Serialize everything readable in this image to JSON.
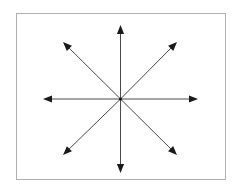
{
  "figure": {
    "type": "diagram",
    "canvas": {
      "width": 240,
      "height": 191,
      "background": "#ffffff"
    },
    "frame": {
      "name": "rectangular-border",
      "x": 16,
      "y": 13,
      "width": 210,
      "height": 167,
      "stroke_color": "#b0b0b0",
      "stroke_width": 1,
      "fill": "#ffffff"
    },
    "center": {
      "x": 120.5,
      "y": 99,
      "label": "origin"
    },
    "line_style": {
      "stroke_color": "#4a4a4a",
      "stroke_width": 1,
      "arrowhead_color": "#1a1a1a",
      "arrowhead_length": 9,
      "arrowhead_half_width": 3.6
    },
    "arrow_count": 8,
    "arrows": [
      {
        "name": "arrow-north",
        "direction": "N",
        "angle_deg": 90,
        "tip_x": 120.5,
        "tip_y": 25
      },
      {
        "name": "arrow-northeast",
        "direction": "NE",
        "angle_deg": 45,
        "tip_x": 177,
        "tip_y": 42
      },
      {
        "name": "arrow-east",
        "direction": "E",
        "angle_deg": 0,
        "tip_x": 198,
        "tip_y": 99
      },
      {
        "name": "arrow-southeast",
        "direction": "SE",
        "angle_deg": -45,
        "tip_x": 177,
        "tip_y": 155
      },
      {
        "name": "arrow-south",
        "direction": "S",
        "angle_deg": -90,
        "tip_x": 120.5,
        "tip_y": 173
      },
      {
        "name": "arrow-southwest",
        "direction": "SW",
        "angle_deg": 225,
        "tip_x": 63,
        "tip_y": 155
      },
      {
        "name": "arrow-west",
        "direction": "W",
        "angle_deg": 180,
        "tip_x": 43,
        "tip_y": 99
      },
      {
        "name": "arrow-northwest",
        "direction": "NW",
        "angle_deg": 135,
        "tip_x": 63,
        "tip_y": 42
      }
    ]
  }
}
